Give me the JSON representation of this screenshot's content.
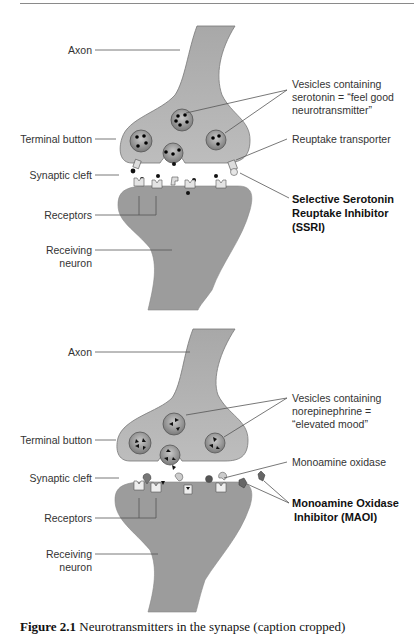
{
  "figure": {
    "top_diagram": {
      "title": "SSRI mechanism",
      "labels": {
        "axon": "Axon",
        "terminal_button": "Terminal button",
        "synaptic_cleft": "Synaptic cleft",
        "receptors": "Receptors",
        "receiving_neuron_line1": "Receiving",
        "receiving_neuron_line2": "neuron",
        "vesicles_line1": "Vesicles containing",
        "vesicles_line2": "serotonin = “feel good",
        "vesicles_line3": "neurotransmitter”",
        "reuptake_transporter": "Reuptake transporter",
        "ssri_line1": "Selective Serotonin",
        "ssri_line2": "Reuptake Inhibitor",
        "ssri_line3": "(SSRI)"
      }
    },
    "bottom_diagram": {
      "title": "MAOI mechanism",
      "labels": {
        "axon": "Axon",
        "terminal_button": "Terminal button",
        "synaptic_cleft": "Synaptic cleft",
        "receptors": "Receptors",
        "receiving_neuron_line1": "Receiving",
        "receiving_neuron_line2": "neuron",
        "vesicles_line1": "Vesicles containing",
        "vesicles_line2": "norepinephrine =",
        "vesicles_line3": "“elevated mood”",
        "monoamine_oxidase": "Monoamine oxidase",
        "maoi_line1": "Monoamine Oxidase",
        "maoi_line2": "Inhibitor (MAOI)"
      }
    },
    "caption": {
      "prefix": "Figure 2.1",
      "text": "Neurotransmitters in the synapse (caption cropped)"
    },
    "colors": {
      "neuron_fill": "#9c9c9c",
      "terminal_fill": "#b4b4b4",
      "vesicle_fill": "#8e8e8e",
      "text": "#333333"
    }
  }
}
